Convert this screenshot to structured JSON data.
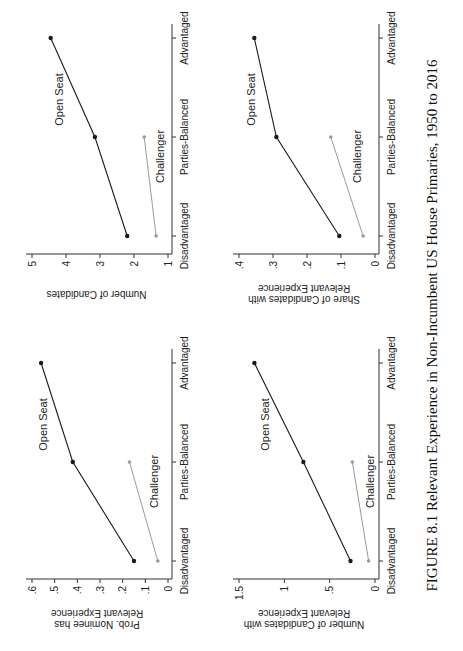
{
  "caption": "FIGURE 8.1  Relevant Experience in Non-Incumbent US House Primaries, 1950 to 2016",
  "colors": {
    "open_seat": "#1a1a1a",
    "challenger": "#9a9a9a",
    "axis": "#333333"
  },
  "chart_data": [
    {
      "type": "line",
      "position": "top-left",
      "title": "",
      "xlabel": "",
      "ylabel": "Prob. Nominee has Relevant Experience",
      "categories": [
        "Disadvantaged",
        "Parties-Balanced",
        "Advantaged"
      ],
      "ylim": [
        0,
        0.6
      ],
      "yticks": [
        0,
        0.1,
        0.2,
        0.3,
        0.4,
        0.5,
        0.6
      ],
      "ytick_labels": [
        "0",
        ".1",
        ".2",
        ".3",
        ".4",
        ".5",
        ".6"
      ],
      "series": [
        {
          "name": "Open Seat",
          "values": [
            0.15,
            0.42,
            0.56
          ]
        },
        {
          "name": "Challenger",
          "values": [
            0.045,
            0.17,
            null
          ]
        }
      ],
      "grid": false,
      "legend": "inline labels"
    },
    {
      "type": "line",
      "position": "top-right",
      "title": "",
      "xlabel": "",
      "ylabel": "Number of Candidates",
      "categories": [
        "Disadvantaged",
        "Parties-Balanced",
        "Advantaged"
      ],
      "ylim": [
        1,
        5
      ],
      "yticks": [
        1,
        2,
        3,
        4,
        5
      ],
      "ytick_labels": [
        "1",
        "2",
        "3",
        "4",
        "5"
      ],
      "series": [
        {
          "name": "Open Seat",
          "values": [
            2.2,
            3.15,
            4.45
          ]
        },
        {
          "name": "Challenger",
          "values": [
            1.35,
            1.7,
            null
          ]
        }
      ],
      "grid": false,
      "legend": "inline labels"
    },
    {
      "type": "line",
      "position": "bottom-left",
      "title": "",
      "xlabel": "",
      "ylabel": "Number of Candidates with Relevant Experience",
      "categories": [
        "Disadvantaged",
        "Parties-Balanced",
        "Advantaged"
      ],
      "ylim": [
        0,
        1.5
      ],
      "yticks": [
        0,
        0.5,
        1,
        1.5
      ],
      "ytick_labels": [
        "0",
        ".5",
        "1",
        "1.5"
      ],
      "series": [
        {
          "name": "Open Seat",
          "values": [
            0.27,
            0.79,
            1.33
          ]
        },
        {
          "name": "Challenger",
          "values": [
            0.07,
            0.25,
            null
          ]
        }
      ],
      "grid": false,
      "legend": "inline labels"
    },
    {
      "type": "line",
      "position": "bottom-right",
      "title": "",
      "xlabel": "",
      "ylabel": "Share of Candidates with Relevant Experience",
      "categories": [
        "Disadvantaged",
        "Parties-Balanced",
        "Advantaged"
      ],
      "ylim": [
        0,
        0.4
      ],
      "yticks": [
        0,
        0.1,
        0.2,
        0.3,
        0.4
      ],
      "ytick_labels": [
        "0",
        ".1",
        ".2",
        ".3",
        ".4"
      ],
      "series": [
        {
          "name": "Open Seat",
          "values": [
            0.105,
            0.29,
            0.355
          ]
        },
        {
          "name": "Challenger",
          "values": [
            0.035,
            0.13,
            null
          ]
        }
      ],
      "grid": false,
      "legend": "inline labels"
    }
  ],
  "panels": [
    {
      "ylabel_line1": "Prob. Nominee has",
      "ylabel_line2": "Relevant Experience"
    },
    {
      "ylabel_line1": "Number of Candidates",
      "ylabel_line2": ""
    },
    {
      "ylabel_line1": "Number of Candidates with",
      "ylabel_line2": "Relevant Experience"
    },
    {
      "ylabel_line1": "Share of Candidates with",
      "ylabel_line2": "Relevant Experience"
    }
  ]
}
